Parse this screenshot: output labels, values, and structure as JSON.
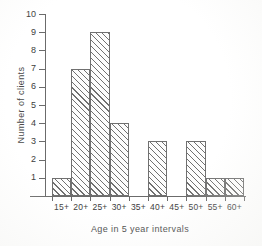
{
  "chart_data": {
    "type": "bar",
    "title": "",
    "subtitle": "",
    "xlabel": "Age in 5 year intervals",
    "ylabel": "Number of clients",
    "categories": [
      "15+",
      "20+",
      "25+",
      "30+",
      "35+",
      "40+",
      "45+",
      "50+",
      "55+",
      "60+"
    ],
    "values": [
      1,
      7,
      9,
      4,
      0,
      3,
      0,
      3,
      1,
      1
    ],
    "series": [
      {
        "name": "Number of clients",
        "values": [
          1,
          7,
          9,
          4,
          0,
          3,
          0,
          3,
          1,
          1
        ]
      }
    ],
    "ylim": [
      0,
      10
    ],
    "ytick_labels": [
      "1",
      "2",
      "3",
      "4",
      "5",
      "6",
      "7",
      "8",
      "9",
      "10"
    ],
    "ytick_values": [
      1,
      2,
      3,
      4,
      5,
      6,
      7,
      8,
      9,
      10
    ],
    "xtick_labels": [
      "15+",
      "20+",
      "25+",
      "30+",
      "35+",
      "40+",
      "45+",
      "50+",
      "55+",
      "60+"
    ],
    "grid": false,
    "legend": null,
    "legend_position": "none",
    "annotations": [],
    "bar_fill": "diagonal-hatch",
    "colors": {
      "axis": "#6b6b6b",
      "bar_outline": "#707070",
      "bar_hatch": "#696969",
      "text": "#3d3d3d",
      "background": "#ffffff"
    }
  }
}
